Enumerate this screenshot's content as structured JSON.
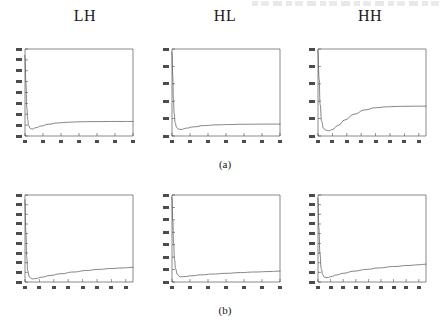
{
  "figure": {
    "column_headers": [
      "LH",
      "HL",
      "HH"
    ],
    "subfigure_labels": [
      "(a)",
      "(b)"
    ],
    "scan_artifact_top": ""
  },
  "chart_data": [
    {
      "type": "line",
      "title": "LH",
      "panel": "a-LH",
      "xlabel": "",
      "ylabel": "",
      "xlim": [
        0,
        60
      ],
      "ylim": [
        0,
        1
      ],
      "grid": false,
      "legend": null,
      "tick_labels_legible": false,
      "xticks": [
        0,
        10,
        20,
        30,
        40,
        50,
        60
      ],
      "yticks": [
        0,
        0.125,
        0.25,
        0.375,
        0.5,
        0.625,
        0.75,
        0.875,
        1
      ],
      "series": [
        {
          "name": "curve",
          "x": [
            0,
            0.5,
            1,
            1.5,
            2,
            3,
            4,
            6,
            9,
            13,
            18,
            24,
            30,
            36,
            42,
            48,
            54,
            60
          ],
          "y": [
            0.93,
            0.62,
            0.33,
            0.19,
            0.12,
            0.085,
            0.08,
            0.095,
            0.115,
            0.135,
            0.15,
            0.158,
            0.163,
            0.165,
            0.166,
            0.167,
            0.167,
            0.167
          ]
        }
      ]
    },
    {
      "type": "line",
      "title": "HL",
      "panel": "a-HL",
      "xlabel": "",
      "ylabel": "",
      "xlim": [
        0,
        60
      ],
      "ylim": [
        0,
        1
      ],
      "grid": false,
      "legend": null,
      "tick_labels_legible": false,
      "xticks": [
        0,
        10,
        20,
        30,
        40,
        50,
        60
      ],
      "yticks": [
        0,
        0.2,
        0.4,
        0.6,
        0.8,
        1
      ],
      "series": [
        {
          "name": "curve",
          "x": [
            0,
            0.4,
            0.8,
            1.2,
            1.8,
            2.5,
            3.5,
            5,
            8,
            12,
            18,
            25,
            32,
            40,
            48,
            56,
            60
          ],
          "y": [
            0.97,
            0.7,
            0.42,
            0.26,
            0.15,
            0.1,
            0.08,
            0.075,
            0.09,
            0.105,
            0.12,
            0.128,
            0.132,
            0.135,
            0.136,
            0.137,
            0.137
          ]
        }
      ]
    },
    {
      "type": "line",
      "title": "HH",
      "panel": "a-HH",
      "xlabel": "",
      "ylabel": "",
      "xlim": [
        0,
        60
      ],
      "ylim": [
        0,
        1
      ],
      "grid": false,
      "legend": null,
      "tick_labels_legible": false,
      "xticks": [
        0,
        8,
        16,
        24,
        32,
        40,
        48,
        56
      ],
      "yticks": [
        0,
        0.2,
        0.4,
        0.6,
        0.8,
        1
      ],
      "series": [
        {
          "name": "curve",
          "x": [
            0,
            0.6,
            1.2,
            2,
            3,
            4.5,
            6,
            8,
            11,
            15,
            20,
            26,
            32,
            38,
            44,
            50,
            56,
            60
          ],
          "y": [
            0.99,
            0.66,
            0.36,
            0.17,
            0.09,
            0.065,
            0.06,
            0.075,
            0.12,
            0.185,
            0.25,
            0.3,
            0.325,
            0.335,
            0.34,
            0.342,
            0.343,
            0.343
          ]
        }
      ]
    },
    {
      "type": "line",
      "title": "LH",
      "panel": "b-LH",
      "xlabel": "",
      "ylabel": "",
      "xlim": [
        0,
        60
      ],
      "ylim": [
        0,
        1
      ],
      "grid": false,
      "legend": null,
      "tick_labels_legible": false,
      "xticks": [
        0,
        8,
        16,
        24,
        32,
        40,
        48,
        56
      ],
      "yticks": [
        0,
        0.111,
        0.222,
        0.333,
        0.444,
        0.556,
        0.667,
        0.778,
        0.889,
        1
      ],
      "series": [
        {
          "name": "curve",
          "x": [
            0,
            0.5,
            1,
            1.5,
            2.5,
            4,
            6,
            9,
            14,
            20,
            27,
            34,
            41,
            48,
            54,
            60
          ],
          "y": [
            0.95,
            0.58,
            0.28,
            0.13,
            0.055,
            0.035,
            0.04,
            0.055,
            0.075,
            0.095,
            0.115,
            0.132,
            0.145,
            0.155,
            0.162,
            0.168
          ]
        }
      ]
    },
    {
      "type": "line",
      "title": "HL",
      "panel": "b-HL",
      "xlabel": "",
      "ylabel": "",
      "xlim": [
        0,
        60
      ],
      "ylim": [
        0,
        1
      ],
      "grid": false,
      "legend": null,
      "tick_labels_legible": false,
      "xticks": [
        0,
        10,
        20,
        30,
        40,
        50,
        60
      ],
      "yticks": [
        0,
        0.143,
        0.286,
        0.429,
        0.571,
        0.714,
        0.857,
        1
      ],
      "series": [
        {
          "name": "curve",
          "x": [
            0,
            0.4,
            0.9,
            1.4,
            2,
            3,
            4.5,
            7,
            11,
            16,
            23,
            30,
            38,
            46,
            54,
            60
          ],
          "y": [
            0.98,
            0.72,
            0.45,
            0.26,
            0.15,
            0.085,
            0.06,
            0.062,
            0.072,
            0.082,
            0.092,
            0.1,
            0.108,
            0.115,
            0.12,
            0.125
          ]
        }
      ]
    },
    {
      "type": "line",
      "title": "HH",
      "panel": "b-HH",
      "xlabel": "",
      "ylabel": "",
      "xlim": [
        0,
        60
      ],
      "ylim": [
        0,
        1
      ],
      "grid": false,
      "legend": null,
      "tick_labels_legible": false,
      "xticks": [
        0,
        7,
        14,
        21,
        28,
        35,
        42,
        49,
        56
      ],
      "yticks": [
        0,
        0.111,
        0.222,
        0.333,
        0.444,
        0.556,
        0.667,
        0.778,
        0.889,
        1
      ],
      "series": [
        {
          "name": "curve",
          "x": [
            0,
            0.5,
            1.1,
            1.8,
            2.6,
            3.6,
            5,
            7,
            10,
            14,
            20,
            27,
            34,
            42,
            50,
            56,
            60
          ],
          "y": [
            0.97,
            0.62,
            0.32,
            0.155,
            0.085,
            0.055,
            0.05,
            0.06,
            0.08,
            0.1,
            0.125,
            0.145,
            0.162,
            0.178,
            0.19,
            0.198,
            0.205
          ]
        }
      ]
    }
  ]
}
